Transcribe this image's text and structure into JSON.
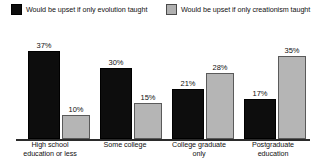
{
  "chart_data": {
    "type": "bar",
    "title": "",
    "subtitle": "",
    "xlabel": "",
    "ylabel": "",
    "ylim": [
      0,
      40
    ],
    "grid": false,
    "legend_position": "top",
    "categories": [
      "High school education or less",
      "Some college",
      "College graduate only",
      "Postgraduate education"
    ],
    "category_lines": [
      [
        "High school",
        "education or less"
      ],
      [
        "Some college"
      ],
      [
        "College graduate",
        "only"
      ],
      [
        "Postgraduate",
        "education"
      ]
    ],
    "series": [
      {
        "name": "Would be upset if only evolution taught",
        "color": "#0d0d0d",
        "values": [
          37,
          30,
          21,
          17
        ],
        "labels": [
          "37%",
          "30%",
          "21%",
          "17%"
        ]
      },
      {
        "name": "Would be upset if only creationism taught",
        "color": "#b5b5b5",
        "values": [
          10,
          15,
          28,
          35
        ],
        "labels": [
          "10%",
          "15%",
          "28%",
          "35%"
        ]
      }
    ]
  },
  "legend": {
    "items": [
      {
        "label": "Would be upset if only evolution taught",
        "swatch": "dark-square-swatch"
      },
      {
        "label": "Would be upset if only creationism taught",
        "swatch": "light-square-swatch"
      }
    ]
  }
}
